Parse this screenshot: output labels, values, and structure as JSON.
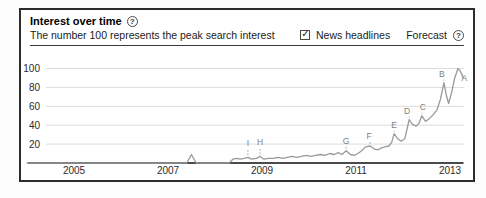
{
  "header": {
    "title": "Interest over time",
    "help_icon": "?",
    "subtitle": "The number 100 represents the peak search interest"
  },
  "controls": {
    "news_checkbox_checked": true,
    "checkbox_glyph": "✓",
    "news_label": "News headlines",
    "forecast_label": "Forecast",
    "forecast_help_icon": "?"
  },
  "chart_data": {
    "type": "line",
    "title": "Interest over time",
    "subtitle": "The number 100 represents the peak search interest",
    "ylabel": "Search interest (100 = peak)",
    "xlabel": "Year",
    "ylim": [
      0,
      100
    ],
    "xlim_years": [
      2004.0,
      2013.35
    ],
    "grid": true,
    "y_ticks": [
      100,
      80,
      60,
      40,
      20
    ],
    "x_ticks": [
      {
        "label": "2005",
        "year": 2005
      },
      {
        "label": "2007",
        "year": 2007
      },
      {
        "label": "2009",
        "year": 2009
      },
      {
        "label": "2011",
        "year": 2011
      },
      {
        "label": "2013",
        "year": 2013
      }
    ],
    "series": [
      {
        "name": "search-interest",
        "points": [
          [
            2004.0,
            0
          ],
          [
            2004.5,
            0
          ],
          [
            2005.0,
            0
          ],
          [
            2005.5,
            0
          ],
          [
            2006.0,
            0
          ],
          [
            2006.5,
            0
          ],
          [
            2007.0,
            0
          ],
          [
            2007.4,
            0
          ],
          [
            2007.5,
            9
          ],
          [
            2007.6,
            0
          ],
          [
            2007.8,
            0
          ],
          [
            2008.0,
            0
          ],
          [
            2008.3,
            0
          ],
          [
            2008.38,
            4
          ],
          [
            2008.46,
            5
          ],
          [
            2008.54,
            4
          ],
          [
            2008.62,
            5
          ],
          [
            2008.7,
            6
          ],
          [
            2008.78,
            4
          ],
          [
            2008.88,
            5
          ],
          [
            2008.96,
            7
          ],
          [
            2009.04,
            4
          ],
          [
            2009.14,
            5
          ],
          [
            2009.24,
            5
          ],
          [
            2009.34,
            6
          ],
          [
            2009.44,
            5
          ],
          [
            2009.54,
            6
          ],
          [
            2009.64,
            7
          ],
          [
            2009.74,
            6
          ],
          [
            2009.84,
            7
          ],
          [
            2009.94,
            8
          ],
          [
            2010.04,
            7
          ],
          [
            2010.14,
            8
          ],
          [
            2010.24,
            9
          ],
          [
            2010.34,
            8
          ],
          [
            2010.44,
            10
          ],
          [
            2010.54,
            9
          ],
          [
            2010.62,
            11
          ],
          [
            2010.7,
            9
          ],
          [
            2010.79,
            13
          ],
          [
            2010.88,
            9
          ],
          [
            2010.96,
            8
          ],
          [
            2011.04,
            10
          ],
          [
            2011.12,
            13
          ],
          [
            2011.2,
            17
          ],
          [
            2011.3,
            18
          ],
          [
            2011.38,
            15
          ],
          [
            2011.46,
            14
          ],
          [
            2011.54,
            16
          ],
          [
            2011.62,
            17
          ],
          [
            2011.7,
            18
          ],
          [
            2011.76,
            22
          ],
          [
            2011.81,
            31
          ],
          [
            2011.88,
            26
          ],
          [
            2011.96,
            23
          ],
          [
            2012.04,
            26
          ],
          [
            2012.13,
            46
          ],
          [
            2012.2,
            41
          ],
          [
            2012.28,
            39
          ],
          [
            2012.34,
            42
          ],
          [
            2012.4,
            50
          ],
          [
            2012.48,
            44
          ],
          [
            2012.56,
            47
          ],
          [
            2012.64,
            51
          ],
          [
            2012.72,
            56
          ],
          [
            2012.8,
            68
          ],
          [
            2012.87,
            85
          ],
          [
            2012.92,
            72
          ],
          [
            2012.97,
            63
          ],
          [
            2013.04,
            76
          ],
          [
            2013.1,
            90
          ],
          [
            2013.17,
            100
          ],
          [
            2013.22,
            97
          ],
          [
            2013.28,
            90
          ]
        ]
      }
    ],
    "annotations": [
      {
        "letter": "A",
        "year": 2013.22,
        "value": 97,
        "dx": 4,
        "dy": 10
      },
      {
        "letter": "B",
        "year": 2012.87,
        "value": 85,
        "dx": -2,
        "dy": -6
      },
      {
        "letter": "C",
        "year": 2012.4,
        "value": 50,
        "dx": 1,
        "dy": -6
      },
      {
        "letter": "D",
        "year": 2012.13,
        "value": 46,
        "dx": -2,
        "dy": -6
      },
      {
        "letter": "E",
        "year": 2011.81,
        "value": 31,
        "dx": 0,
        "dy": -6
      },
      {
        "letter": "F",
        "year": 2011.3,
        "value": 18,
        "dx": -1,
        "dy": -7
      },
      {
        "letter": "G",
        "year": 2010.79,
        "value": 13,
        "dx": 0,
        "dy": -7
      },
      {
        "letter": "H",
        "year": 2008.96,
        "value": 7,
        "dx": 0,
        "dy": -11
      },
      {
        "letter": "I",
        "year": 2008.7,
        "value": 6,
        "dx": 0,
        "dy": -11
      }
    ],
    "colors": {
      "line": "#9a9a9a",
      "grid": "#dcdcdc",
      "axis": "#4a4a4a",
      "annotation_letter": "#7e7e7e",
      "tick_text": "#2b2b2b"
    },
    "legend_position": "none"
  }
}
